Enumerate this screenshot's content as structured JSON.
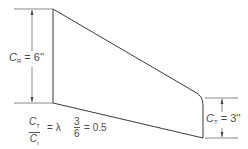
{
  "diagram": {
    "root_chord_label": {
      "symbol": "C",
      "subscript": "R",
      "equals": "=",
      "value": "6''"
    },
    "tip_chord_label": {
      "symbol": "C",
      "subscript": "T",
      "equals": "=",
      "value": "3''"
    },
    "taper_ratio": {
      "numerator": {
        "symbol": "C",
        "subscript": "T"
      },
      "denominator": {
        "symbol": "C",
        "subscript": "r"
      },
      "equals": "=",
      "lambda": "λ",
      "num_value": "3",
      "den_value": "6",
      "result_equals": "=",
      "result": "0.5"
    },
    "colors": {
      "line": "#3a3a3a",
      "text": "#4a4a4a",
      "background": "#ffffff"
    }
  }
}
